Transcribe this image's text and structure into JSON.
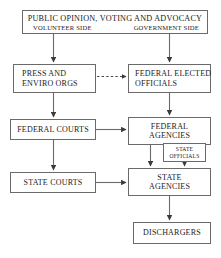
{
  "diagram": {
    "stroke_color": "#6a6a6a",
    "text_color": "#1a1a1a",
    "background": "#ffffff",
    "nodes": {
      "public_opinion": {
        "headline": "PUBLIC OPINION,  VOTING AND ADVOCACY",
        "left_side": "VOLUNTEER SIDE",
        "right_side": "GOVERNMENT SIDE"
      },
      "press": {
        "line1": "PRESS AND",
        "line2": "ENVIRO ORGS"
      },
      "federal_elected": {
        "line1": "FEDERAL ELECTED",
        "line2": "OFFICIALS"
      },
      "federal_courts": {
        "label": "FEDERAL COURTS"
      },
      "federal_agencies": {
        "line1": "FEDERAL",
        "line2": "AGENCIES"
      },
      "state_officials": {
        "line1": "STATE",
        "line2": "OFFICIALS"
      },
      "state_courts": {
        "label": "STATE COURTS"
      },
      "state_agencies": {
        "line1": "STATE",
        "line2": "AGENCIES"
      },
      "dischargers": {
        "label": "DISCHARGERS"
      }
    },
    "edges": [
      {
        "name": "public-opinion-to-press",
        "style": "solid",
        "from": "public_opinion",
        "to": "press"
      },
      {
        "name": "public-opinion-to-federal-elected",
        "style": "solid",
        "from": "public_opinion",
        "to": "federal_elected"
      },
      {
        "name": "press-to-federal-elected",
        "style": "dashed",
        "from": "press",
        "to": "federal_elected"
      },
      {
        "name": "press-to-federal-courts",
        "style": "solid",
        "from": "press",
        "to": "federal_courts"
      },
      {
        "name": "federal-elected-to-federal-agencies",
        "style": "solid",
        "from": "federal_elected",
        "to": "federal_agencies"
      },
      {
        "name": "federal-courts-to-federal-agencies",
        "style": "solid",
        "from": "federal_courts",
        "to": "federal_agencies"
      },
      {
        "name": "federal-courts-to-state-courts",
        "style": "solid",
        "from": "federal_courts",
        "to": "state_courts"
      },
      {
        "name": "federal-agencies-to-state-agencies",
        "style": "solid",
        "from": "federal_agencies",
        "to": "state_agencies"
      },
      {
        "name": "state-officials-to-state-agencies",
        "style": "solid",
        "from": "state_officials",
        "to": "state_agencies"
      },
      {
        "name": "state-courts-to-state-agencies",
        "style": "solid",
        "from": "state_courts",
        "to": "state_agencies"
      },
      {
        "name": "state-agencies-to-dischargers",
        "style": "solid",
        "from": "state_agencies",
        "to": "dischargers"
      }
    ]
  }
}
